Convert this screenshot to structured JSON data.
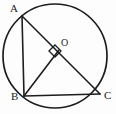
{
  "figure": {
    "kind": "circle-geometry-diagram",
    "canvas": {
      "width": 116,
      "height": 114
    },
    "background_color": "#fdfdfd",
    "stroke_color": "#1d1d1d",
    "label_color": "#1d1d1d",
    "circle": {
      "cx": 55,
      "cy": 56,
      "r": 52,
      "stroke_width": 1.6
    },
    "labels": [
      {
        "name": "A",
        "text": "A",
        "x": 10,
        "y": 3
      },
      {
        "name": "B",
        "text": "B",
        "x": 11,
        "y": 91
      },
      {
        "name": "C",
        "text": "C",
        "x": 104,
        "y": 90
      },
      {
        "name": "O",
        "text": "O",
        "x": 61,
        "y": 38
      }
    ],
    "points": [
      {
        "name": "A",
        "x": 22,
        "y": 16
      },
      {
        "name": "B",
        "x": 24,
        "y": 96
      },
      {
        "name": "C",
        "x": 100,
        "y": 94
      },
      {
        "name": "O",
        "x": 57,
        "y": 52
      },
      {
        "name": "D",
        "x": 56,
        "y": 53
      }
    ],
    "segments": [
      {
        "name": "segment-AB",
        "from": "A",
        "to": "B",
        "x1": 22,
        "y1": 16,
        "x2": 24,
        "y2": 96
      },
      {
        "name": "segment-BC",
        "from": "B",
        "to": "C",
        "x1": 24,
        "y1": 96,
        "x2": 100,
        "y2": 94
      },
      {
        "name": "segment-AC",
        "from": "A",
        "to": "C",
        "x1": 22,
        "y1": 16,
        "x2": 100,
        "y2": 94
      },
      {
        "name": "segment-BO",
        "from": "B",
        "to": "D",
        "x1": 24,
        "y1": 96,
        "x2": 59,
        "y2": 50
      }
    ],
    "right_angle_mark": {
      "name": "right-angle-mark",
      "at": "D",
      "points": "49,51 55,45 61,51 55,57",
      "size": 12
    }
  }
}
